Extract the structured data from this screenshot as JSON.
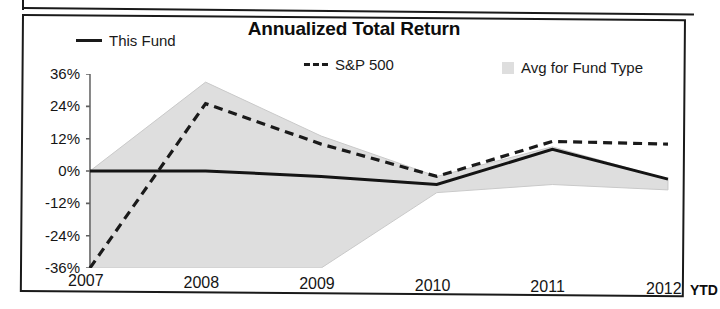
{
  "chart_data": {
    "type": "line",
    "title": "Annualized Total Return",
    "xlabel": "",
    "ylabel": "",
    "categories": [
      "2007",
      "2008",
      "2009",
      "2010",
      "2011",
      "2012"
    ],
    "x_axis_suffix_label": "YTD",
    "y_tick_labels": [
      "36%",
      "24%",
      "12%",
      "0%",
      "-12%",
      "-24%",
      "-36%"
    ],
    "y_tick_values": [
      36,
      24,
      12,
      0,
      -12,
      -24,
      -36
    ],
    "ylim": [
      -36,
      36
    ],
    "grid": false,
    "legend_position": "top",
    "series": [
      {
        "name": "This Fund",
        "style": "solid",
        "color": "#1a1a1a",
        "values": [
          0,
          0,
          -2,
          -5,
          8,
          -3
        ]
      },
      {
        "name": "S&P 500",
        "style": "dashed",
        "color": "#1a1a1a",
        "values": [
          -36,
          25,
          10,
          -2,
          11,
          10
        ]
      },
      {
        "name": "Avg for Fund Type",
        "style": "band",
        "color": "#dedede",
        "band_upper": [
          0,
          33,
          13,
          -2,
          9,
          -3
        ],
        "band_lower": [
          -36,
          -36,
          -36,
          -8,
          -5,
          -7
        ]
      }
    ],
    "legend": [
      {
        "label": "This Fund",
        "marker": "solid-line"
      },
      {
        "label": "S&P 500",
        "marker": "dashed-line"
      },
      {
        "label": "Avg for Fund Type",
        "marker": "gray-square"
      }
    ]
  }
}
